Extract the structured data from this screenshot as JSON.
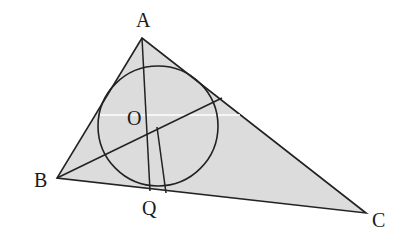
{
  "diagram": {
    "type": "geometry",
    "colors": {
      "fill": "#dcdcdc",
      "stroke": "#222222",
      "background": "#ffffff",
      "highlight_line": "#ffffff"
    },
    "points": {
      "A": {
        "label": "A",
        "x": 142,
        "y": 38
      },
      "B": {
        "label": "B",
        "x": 57,
        "y": 178
      },
      "C": {
        "label": "C",
        "x": 366,
        "y": 213
      },
      "O": {
        "label": "O",
        "x": 157,
        "y": 127
      },
      "Q": {
        "label": "Q",
        "x": 150,
        "y": 191
      }
    },
    "circle": {
      "cx": 158,
      "cy": 126,
      "r": 60
    },
    "labels": {
      "A": "A",
      "B": "B",
      "C": "C",
      "O": "O",
      "Q": "Q"
    }
  }
}
